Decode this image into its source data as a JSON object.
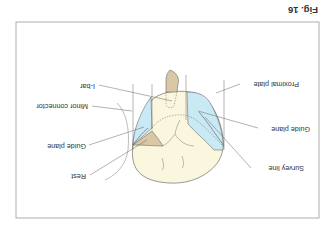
{
  "figure": {
    "caption": "Fig. 16",
    "orientation": "rotated 180 degrees"
  },
  "labels": {
    "i_bar": "I-bar",
    "minor_connector": "Minor connector",
    "guide_plane_left": "Guide plane",
    "rest": "Rest",
    "proximal_plate": "Proximal plate",
    "guide_plane_right": "Guide plane",
    "survey_line": "Survey line"
  },
  "colors": {
    "tooth_fill": "#fbf7de",
    "guide_plane_fill": "#c9e9f4",
    "metal_fill": "#d9c7a6",
    "outline": "#6b6b6b",
    "leader": "#555555",
    "frame": "#9a9a9a"
  }
}
